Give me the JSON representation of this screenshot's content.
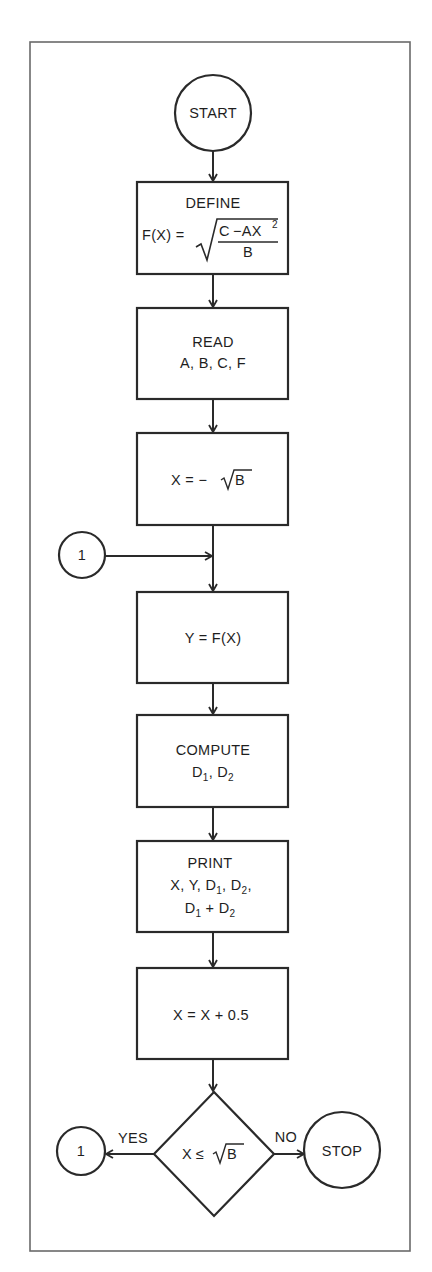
{
  "flowchart": {
    "start": {
      "label": "START"
    },
    "define": {
      "title": "DEFINE",
      "formula_lhs": "F(X) =",
      "formula_numerator_c": "C",
      "formula_numerator_minus": "−AX",
      "formula_numerator_exp": "2",
      "formula_denominator": "B"
    },
    "read": {
      "title": "READ",
      "variables": "A, B, C, F"
    },
    "init_x": {
      "lhs": "X = −",
      "radicand": "B"
    },
    "connector_in": {
      "label": "1"
    },
    "compute_y": {
      "label": "Y = F(X)"
    },
    "compute_d": {
      "title": "COMPUTE",
      "d": "D",
      "sub1": "1",
      "sep": ", ",
      "sub2": "2"
    },
    "print": {
      "title": "PRINT",
      "line1": [
        {
          "t": "X, Y, D"
        },
        {
          "sub": "1"
        },
        {
          "t": ", D"
        },
        {
          "sub": "2"
        },
        {
          "t": ","
        }
      ],
      "line2": [
        {
          "t": "D"
        },
        {
          "sub": "1"
        },
        {
          "t": " + D"
        },
        {
          "sub": "2"
        }
      ]
    },
    "increment": {
      "label": "X = X + 0.5"
    },
    "decision": {
      "lhs": "X",
      "op": "≤",
      "radicand": "B"
    },
    "yes_label": "YES",
    "no_label": "NO",
    "connector_out": {
      "label": "1"
    },
    "stop": {
      "label": "STOP"
    }
  }
}
